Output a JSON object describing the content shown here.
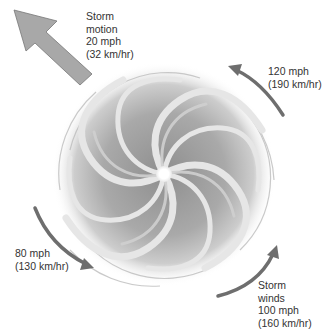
{
  "diagram": {
    "colors": {
      "background": "#ffffff",
      "motion_arrow_fill": "#a8a8a8",
      "motion_arrow_stroke": "#777777",
      "wind_arrow": "#6e6e6e",
      "spiral_dark": "#8e8e8e",
      "spiral_mid": "#b5b5b5",
      "spiral_light": "#dcdcdc",
      "eye": "#ffffff",
      "text": "#333333"
    },
    "eye": {
      "cx": 164,
      "cy": 174,
      "r": 8
    },
    "labels": {
      "storm_motion": {
        "line1": "Storm",
        "line2": "motion",
        "line3": "20 mph",
        "line4": "(32 km/hr)"
      },
      "wind_top_right": {
        "line1": "120 mph",
        "line2": "(190 km/hr)"
      },
      "wind_bottom_left": {
        "line1": "80 mph",
        "line2": "(130 km/hr)"
      },
      "storm_winds": {
        "line1": "Storm",
        "line2": "winds",
        "line3": "100 mph",
        "line4": "(160 km/hr)"
      }
    },
    "arrows": [
      {
        "name": "storm-motion-arrow",
        "kind": "block",
        "direction": "northwest",
        "speed": "20 mph"
      },
      {
        "name": "wind-arrow-120",
        "kind": "curved",
        "direction": "counterclockwise",
        "speed": "120 mph"
      },
      {
        "name": "wind-arrow-80",
        "kind": "curved",
        "direction": "counterclockwise",
        "speed": "80 mph"
      },
      {
        "name": "wind-arrow-100",
        "kind": "curved",
        "direction": "counterclockwise",
        "speed": "100 mph"
      }
    ]
  }
}
